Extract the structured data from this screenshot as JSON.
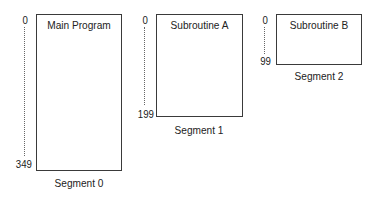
{
  "diagram": {
    "segments": [
      {
        "title": "Main Program",
        "start_address": "0",
        "end_address": "349",
        "label": "Segment 0"
      },
      {
        "title": "Subroutine A",
        "start_address": "0",
        "end_address": "199",
        "label": "Segment 1"
      },
      {
        "title": "Subroutine B",
        "start_address": "0",
        "end_address": "99",
        "label": "Segment 2"
      }
    ]
  }
}
